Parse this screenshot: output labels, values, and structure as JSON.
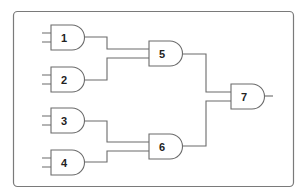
{
  "diagram": {
    "type": "logic-circuit",
    "gate_type": "AND",
    "colors": {
      "stroke": "#6b6b6b",
      "frame": "#7a7a7a",
      "label": "#222222",
      "background": "#ffffff"
    },
    "gates": [
      {
        "id": "1",
        "label": "1",
        "x": 51,
        "y": 25,
        "inputs": 2
      },
      {
        "id": "2",
        "label": "2",
        "x": 51,
        "y": 67,
        "inputs": 2
      },
      {
        "id": "3",
        "label": "3",
        "x": 51,
        "y": 108,
        "inputs": 2
      },
      {
        "id": "4",
        "label": "4",
        "x": 51,
        "y": 150,
        "inputs": 2
      },
      {
        "id": "5",
        "label": "5",
        "x": 149,
        "y": 41,
        "inputs": 2
      },
      {
        "id": "6",
        "label": "6",
        "x": 149,
        "y": 134,
        "inputs": 2
      },
      {
        "id": "7",
        "label": "7",
        "x": 231,
        "y": 84,
        "inputs": 2
      }
    ],
    "connections": [
      {
        "from": "1",
        "to": "5"
      },
      {
        "from": "2",
        "to": "5"
      },
      {
        "from": "3",
        "to": "6"
      },
      {
        "from": "4",
        "to": "6"
      },
      {
        "from": "5",
        "to": "7"
      },
      {
        "from": "6",
        "to": "7"
      }
    ]
  }
}
